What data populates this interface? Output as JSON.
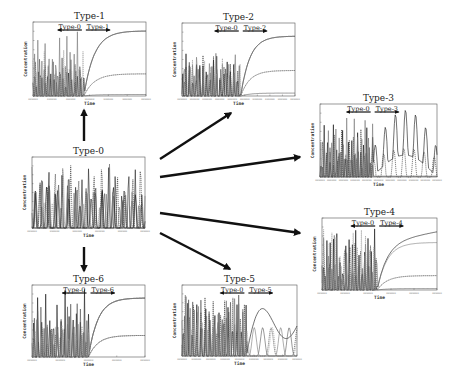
{
  "figure": {
    "axis_x_label": "Time",
    "axis_y_label": "Concentration"
  },
  "panels": [
    {
      "id": "type0",
      "title": "Type-0",
      "box": [
        32,
        157,
        113,
        71
      ],
      "kind": "oscillatory",
      "phase_labels": [],
      "seed": 3,
      "n_series": 6,
      "post": "none",
      "xticks": 5
    },
    {
      "id": "type1",
      "title": "Type-1",
      "box": [
        33,
        22,
        113,
        74
      ],
      "kind": "transition",
      "switch": 0.45,
      "phase_labels": [
        "Type-0",
        "Type-1"
      ],
      "seed": 11,
      "n_series": 5,
      "post": "converge",
      "levels": [
        0.88,
        0.3,
        0.02
      ],
      "xticks": 6
    },
    {
      "id": "type2",
      "title": "Type-2",
      "box": [
        182,
        23,
        113,
        73
      ],
      "kind": "transition",
      "switch": 0.52,
      "phase_labels": [
        "Type-0",
        "Type-2"
      ],
      "seed": 17,
      "n_series": 5,
      "post": "converge",
      "levels": [
        0.82,
        0.35,
        0.04
      ],
      "xticks": 9
    },
    {
      "id": "type3",
      "title": "Type-3",
      "box": [
        320,
        104,
        117,
        73
      ],
      "kind": "transition",
      "switch": 0.45,
      "phase_labels": [
        "Type-0",
        "Type-3"
      ],
      "seed": 23,
      "n_series": 4,
      "post": "oscillate",
      "levels": [
        0.62,
        0.4
      ],
      "xticks": 10
    },
    {
      "id": "type4",
      "title": "Type-4",
      "box": [
        322,
        218,
        115,
        72
      ],
      "kind": "transition",
      "switch": 0.48,
      "phase_labels": [
        "Type-0",
        "Type-4"
      ],
      "seed": 29,
      "n_series": 5,
      "post": "diverge",
      "levels": [
        0.66,
        0.2,
        0.02
      ],
      "xticks": 5
    },
    {
      "id": "type5",
      "title": "Type-5",
      "box": [
        182,
        285,
        115,
        71
      ],
      "kind": "transition",
      "switch": 0.56,
      "phase_labels": [
        "Type-0",
        "Type-5"
      ],
      "seed": 37,
      "n_series": 5,
      "post": "bursts",
      "levels": [
        0.82,
        0.25
      ],
      "xticks": 8
    },
    {
      "id": "type6",
      "title": "Type-6",
      "box": [
        32,
        285,
        113,
        72
      ],
      "kind": "transition",
      "switch": 0.5,
      "phase_labels": [
        "Type-0",
        "Type-6"
      ],
      "seed": 43,
      "n_series": 5,
      "post": "split",
      "levels": [
        0.82,
        0.3
      ],
      "xticks": 4
    }
  ],
  "arrows": [
    {
      "id": "arrow-to-type1",
      "from": [
        84,
        141
      ],
      "to": [
        84,
        110
      ]
    },
    {
      "id": "arrow-to-type2",
      "from": [
        160,
        159
      ],
      "to": [
        231,
        113
      ]
    },
    {
      "id": "arrow-to-type3",
      "from": [
        160,
        177
      ],
      "to": [
        300,
        157
      ]
    },
    {
      "id": "arrow-to-type4",
      "from": [
        160,
        213
      ],
      "to": [
        300,
        233
      ]
    },
    {
      "id": "arrow-to-type5",
      "from": [
        160,
        233
      ],
      "to": [
        230,
        269
      ]
    },
    {
      "id": "arrow-to-type6",
      "from": [
        84,
        247
      ],
      "to": [
        84,
        271
      ]
    }
  ],
  "colors": {
    "background": "#ffffff",
    "arrow": "#111111",
    "series": [
      "#111111",
      "#333333",
      "#555555",
      "#777777",
      "#999999",
      "#222222"
    ]
  }
}
